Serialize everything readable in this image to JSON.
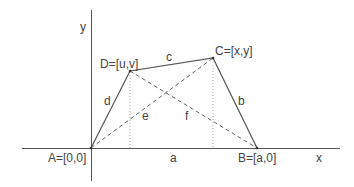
{
  "diagram": {
    "axes": {
      "x_label": "x",
      "y_label": "y"
    },
    "points": {
      "A": "A=[0,0]",
      "B": "B=[a,0]",
      "C": "C=[x,y]",
      "D": "D=[u,v]"
    },
    "segments": {
      "a": "a",
      "b": "b",
      "c": "c",
      "d": "d",
      "e": "e",
      "f": "f"
    },
    "colors": {
      "line": "#555555",
      "dashed": "#666666",
      "dotted": "#aaaaaa",
      "text": "#444444"
    }
  }
}
